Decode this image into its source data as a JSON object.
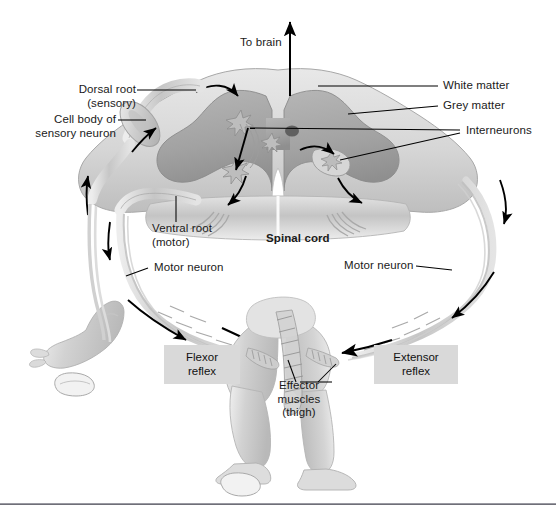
{
  "figure": {
    "width": 556,
    "height": 514,
    "background": "#ffffff",
    "rule_y": 503,
    "rule_color": "#6f6f78"
  },
  "labels": {
    "to_brain": "To brain",
    "dorsal_root": "Dorsal root\n(sensory)",
    "cell_body": "Cell body of\nsensory neuron",
    "white_matter": "White matter",
    "grey_matter": "Grey matter",
    "interneurons": "Interneurons",
    "ventral_root": "Ventral root\n(motor)",
    "spinal_cord": "Spinal cord",
    "motor_neuron_left": "Motor neuron",
    "motor_neuron_right": "Motor neuron",
    "flexor_reflex": "Flexor\nreflex",
    "extensor_reflex": "Extensor\nreflex",
    "effector_muscles": "Effector\nmuscles\n(thigh)"
  },
  "colors": {
    "label_text": "#1a1a1a",
    "box_fill": "#d9d9d9",
    "white_matter": "#d7d7d7",
    "grey_matter": "#a9a9a9",
    "nerve": "#c9c9c9",
    "skin": "#d0d0d0",
    "leader_line": "#000000",
    "arrow": "#000000"
  },
  "structures": [
    {
      "name": "spinal-cord-cross-section",
      "label": "Spinal cord"
    },
    {
      "name": "white-matter",
      "label": "White matter"
    },
    {
      "name": "grey-matter",
      "label": "Grey matter"
    },
    {
      "name": "interneurons",
      "label": "Interneurons"
    },
    {
      "name": "dorsal-root-ganglion",
      "label": "Cell body of sensory neuron"
    },
    {
      "name": "dorsal-root",
      "label": "Dorsal root (sensory)"
    },
    {
      "name": "ventral-root",
      "label": "Ventral root (motor)"
    },
    {
      "name": "motor-neuron-left",
      "label": "Motor neuron"
    },
    {
      "name": "motor-neuron-right",
      "label": "Motor neuron"
    },
    {
      "name": "effector-muscles-thigh",
      "label": "Effector muscles (thigh)"
    },
    {
      "name": "left-leg-flexed",
      "label": "Flexor reflex"
    },
    {
      "name": "right-leg-extended",
      "label": "Extensor reflex"
    }
  ]
}
